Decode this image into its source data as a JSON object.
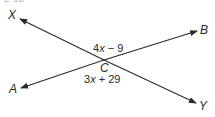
{
  "figure": {
    "cut_off_text": "2-13",
    "points": {
      "X": "X",
      "B": "B",
      "A": "A",
      "Y": "Y",
      "C": "C"
    },
    "angles": {
      "upper": {
        "coef": "4",
        "var": "x",
        "rest": " − 9"
      },
      "lower": {
        "coef": "3",
        "var": "x",
        "rest": " + 29"
      }
    },
    "lines": [
      {
        "name": "line-XY",
        "from": "X",
        "to": "Y",
        "through": "C"
      },
      {
        "name": "line-AB",
        "from": "A",
        "to": "B",
        "through": "C"
      }
    ],
    "colors": {
      "stroke": "#2a2a2a",
      "text": "#2a2a2a"
    }
  }
}
